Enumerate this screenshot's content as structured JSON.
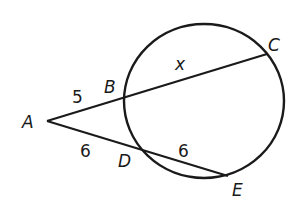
{
  "diagram": {
    "type": "secant-secant theorem",
    "colors": {
      "stroke": "#1a1a1a",
      "background": "#ffffff"
    },
    "circle": {
      "cx": 204,
      "cy": 101,
      "rx": 80,
      "ry": 77
    },
    "points": {
      "A": {
        "label": "A",
        "x": 47,
        "y": 121
      },
      "B": {
        "label": "B",
        "x": 124,
        "y": 97
      },
      "C": {
        "label": "C",
        "x": 267,
        "y": 54
      },
      "D": {
        "label": "D",
        "x": 137,
        "y": 149
      },
      "E": {
        "label": "E",
        "x": 228,
        "y": 176
      }
    },
    "segments": [
      {
        "from": "A",
        "to": "C"
      },
      {
        "from": "A",
        "to": "E"
      }
    ],
    "lengths": {
      "AB": "5",
      "BC": "x",
      "AD": "6",
      "DE": "6"
    }
  }
}
